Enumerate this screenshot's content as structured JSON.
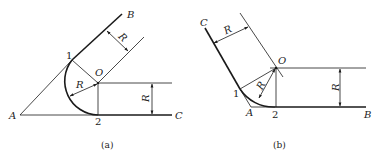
{
  "diagram": {
    "panel_a": {
      "caption": "(a)",
      "labels": {
        "A": "A",
        "B": "B",
        "C": "C",
        "O": "O",
        "point1": "1",
        "point2": "2",
        "radius_arc": "R",
        "radius_parallel": "R",
        "radius_vertical": "R"
      }
    },
    "panel_b": {
      "caption": "(b)",
      "labels": {
        "A": "A",
        "B": "B",
        "C": "C",
        "O": "O",
        "point1": "1",
        "point2": "2",
        "radius_arc": "R",
        "radius_parallel": "R",
        "radius_vertical": "R"
      }
    },
    "colors": {
      "line": "#1a1a1a",
      "background": "#ffffff"
    }
  }
}
